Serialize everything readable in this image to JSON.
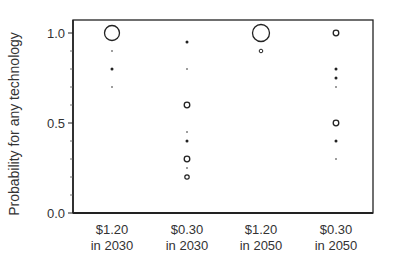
{
  "chart_data": {
    "type": "scatter",
    "title": "",
    "xlabel": "",
    "ylabel": "Probability for any technology",
    "ylim": [
      0.0,
      1.05
    ],
    "yticks": [
      {
        "value": 0.0,
        "label": "0.0"
      },
      {
        "value": 0.5,
        "label": "0.5"
      },
      {
        "value": 1.0,
        "label": "1.0"
      }
    ],
    "minor_yticks": [
      0.1,
      0.2,
      0.3,
      0.4,
      0.6,
      0.7,
      0.8,
      0.9
    ],
    "grid": false,
    "legend": null,
    "marker_note": "Marker size indicates relative frequency/weight; larger open circles = more technologies at that probability",
    "categories": [
      {
        "label_line1": "$1.20",
        "label_line2": "in 2030"
      },
      {
        "label_line1": "$0.30",
        "label_line2": "in 2030"
      },
      {
        "label_line1": "$1.20",
        "label_line2": "in 2050"
      },
      {
        "label_line1": "$0.30",
        "label_line2": "in 2050"
      }
    ],
    "series": [
      {
        "name": "$1.20 in 2030",
        "points": [
          {
            "y": 1.0,
            "size": "large",
            "style": "open"
          },
          {
            "y": 0.9,
            "size": "tiny",
            "style": "filled"
          },
          {
            "y": 0.8,
            "size": "small",
            "style": "filled"
          },
          {
            "y": 0.7,
            "size": "tiny",
            "style": "filled"
          }
        ]
      },
      {
        "name": "$0.30 in 2030",
        "points": [
          {
            "y": 0.95,
            "size": "small",
            "style": "filled"
          },
          {
            "y": 0.8,
            "size": "tiny",
            "style": "filled"
          },
          {
            "y": 0.6,
            "size": "medium",
            "style": "open"
          },
          {
            "y": 0.45,
            "size": "tiny",
            "style": "filled"
          },
          {
            "y": 0.4,
            "size": "small",
            "style": "filled"
          },
          {
            "y": 0.3,
            "size": "medium",
            "style": "open"
          },
          {
            "y": 0.25,
            "size": "tiny",
            "style": "filled"
          },
          {
            "y": 0.2,
            "size": "medium-small",
            "style": "open"
          }
        ]
      },
      {
        "name": "$1.20 in 2050",
        "points": [
          {
            "y": 1.0,
            "size": "xlarge",
            "style": "open"
          },
          {
            "y": 0.9,
            "size": "small-open",
            "style": "open"
          }
        ]
      },
      {
        "name": "$0.30 in 2050",
        "points": [
          {
            "y": 1.0,
            "size": "medium",
            "style": "open"
          },
          {
            "y": 0.8,
            "size": "small",
            "style": "filled"
          },
          {
            "y": 0.75,
            "size": "small",
            "style": "filled"
          },
          {
            "y": 0.7,
            "size": "tiny",
            "style": "filled"
          },
          {
            "y": 0.5,
            "size": "medium",
            "style": "open"
          },
          {
            "y": 0.4,
            "size": "small",
            "style": "filled"
          },
          {
            "y": 0.3,
            "size": "tiny",
            "style": "filled"
          }
        ]
      }
    ]
  }
}
